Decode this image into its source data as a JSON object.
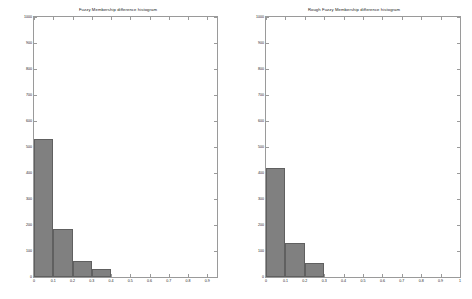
{
  "figure": {
    "background": "#ffffff",
    "bar_color": "#808080",
    "bar_edge_color": "#606060",
    "axis_color": "#9a9a9a"
  },
  "panels": [
    {
      "id": "left",
      "chart_data": {
        "type": "bar",
        "title": "Fuzzy Membership difference histogram",
        "xlabel": "",
        "ylabel": "",
        "grid": false,
        "legend": "none",
        "xlim": [
          0,
          0.95
        ],
        "ylim": [
          0,
          1000
        ],
        "xticks": [
          0,
          0.1,
          0.2,
          0.3,
          0.4,
          0.5,
          0.6,
          0.7,
          0.8,
          0.9
        ],
        "xticklabels": [
          "0",
          "0.1",
          "0.2",
          "0.3",
          "0.4",
          "0.5",
          "0.6",
          "0.7",
          "0.8",
          "0.9"
        ],
        "yticks": [
          0,
          100,
          200,
          300,
          400,
          500,
          600,
          700,
          800,
          900,
          1000
        ],
        "yticklabels": [
          "0",
          "100",
          "200",
          "300",
          "400",
          "500",
          "600",
          "700",
          "800",
          "900",
          "1000"
        ],
        "bin_edges": [
          0.0,
          0.1,
          0.2,
          0.3,
          0.4
        ],
        "categories": [
          "0-0.1",
          "0.1-0.2",
          "0.2-0.3",
          "0.3-0.4"
        ],
        "values": [
          530,
          185,
          62,
          30
        ]
      }
    },
    {
      "id": "right",
      "chart_data": {
        "type": "bar",
        "title": "Rough Fuzzy Membership difference histogram",
        "xlabel": "",
        "ylabel": "",
        "grid": false,
        "legend": "none",
        "xlim": [
          0,
          1.0
        ],
        "ylim": [
          0,
          1000
        ],
        "xticks": [
          0,
          0.1,
          0.2,
          0.3,
          0.4,
          0.5,
          0.6,
          0.7,
          0.8,
          0.9,
          1.0
        ],
        "xticklabels": [
          "0",
          "0.1",
          "0.2",
          "0.3",
          "0.4",
          "0.5",
          "0.6",
          "0.7",
          "0.8",
          "0.9",
          "1"
        ],
        "yticks": [
          0,
          100,
          200,
          300,
          400,
          500,
          600,
          700,
          800,
          900,
          1000
        ],
        "yticklabels": [
          "0",
          "100",
          "200",
          "300",
          "400",
          "500",
          "600",
          "700",
          "800",
          "900",
          "1000"
        ],
        "bin_edges": [
          0.0,
          0.1,
          0.2,
          0.3
        ],
        "categories": [
          "0-0.1",
          "0.1-0.2",
          "0.2-0.3"
        ],
        "values": [
          420,
          130,
          55
        ]
      }
    }
  ]
}
